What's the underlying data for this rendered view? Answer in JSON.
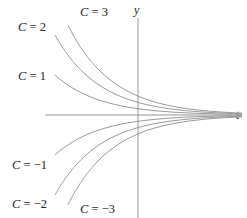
{
  "chart_data": {
    "type": "line",
    "title": "",
    "xlabel": "t",
    "ylabel": "y",
    "function": "y = C e^(-k t)",
    "k": 0.445,
    "grid": false,
    "legend": "inline labels",
    "series": [
      {
        "name": "C = 3",
        "C": 3,
        "label_pos": [
          80,
          12
        ],
        "t_start": -3.5
      },
      {
        "name": "C = 2",
        "C": 2,
        "label_pos": [
          18,
          27
        ],
        "t_start": -4.15
      },
      {
        "name": "C = 1",
        "C": 1,
        "label_pos": [
          18,
          76
        ],
        "t_start": -4.15
      },
      {
        "name": "C = −1",
        "C": -1,
        "label_pos": [
          12,
          165
        ],
        "t_start": -4.15
      },
      {
        "name": "C = −2",
        "C": -2,
        "label_pos": [
          12,
          204
        ],
        "t_start": -4.15
      },
      {
        "name": "C = −3",
        "C": -3,
        "label_pos": [
          80,
          209
        ],
        "t_start": -3.5
      }
    ],
    "x_range": [
      -4.2,
      5.2
    ],
    "asymptote": "y = 0"
  },
  "axes": {
    "x_label": "t",
    "y_label": "y"
  },
  "layout": {
    "origin_px": [
      138,
      115
    ],
    "px_per_t": 20,
    "px_per_unit_y": 6.3,
    "x_axis_end_px": 232,
    "y_axis_top_px": 18,
    "y_axis_bottom_px": 218,
    "x_axis_start_px": 45
  }
}
